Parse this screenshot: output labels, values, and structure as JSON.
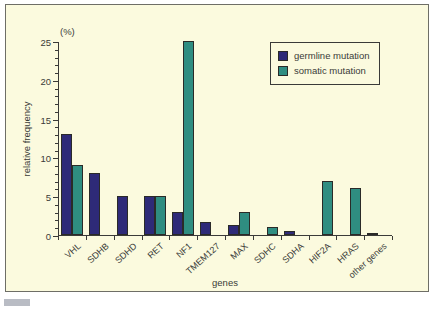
{
  "chart_data": {
    "type": "bar",
    "title": "",
    "xlabel": "genes",
    "ylabel": "relative frequency",
    "unit_label": "(%)",
    "ylim": [
      0,
      25
    ],
    "yticks": [
      0,
      5,
      10,
      15,
      20,
      25
    ],
    "yticks_minor": [
      1,
      2,
      3,
      4,
      6,
      7,
      8,
      9,
      11,
      12,
      13,
      14,
      16,
      17,
      18,
      19,
      21,
      22,
      23,
      24
    ],
    "grid": false,
    "legend_position": "top-right",
    "categories": [
      "VHL",
      "SDHB",
      "SDHD",
      "RET",
      "NF1",
      "TMEM127",
      "MAX",
      "SDHC",
      "SDHA",
      "HIF2A",
      "HRAS",
      "other genes"
    ],
    "series": [
      {
        "name": "germline mutation",
        "color": "#2e2a78",
        "values": [
          13,
          8,
          5,
          5,
          3,
          1.7,
          1.3,
          0,
          0.5,
          0,
          0,
          0.3
        ]
      },
      {
        "name": "somatic mutation",
        "color": "#2f8d81",
        "values": [
          9,
          0,
          0,
          5,
          25,
          0,
          3,
          1,
          0,
          7,
          6,
          0
        ]
      }
    ]
  },
  "legend": {
    "items": [
      {
        "label": "germline mutation",
        "series": "germline"
      },
      {
        "label": "somatic mutation",
        "series": "somatic"
      }
    ]
  },
  "caption": {
    "text": ""
  },
  "colors": {
    "background": "#fbfade",
    "frame": "#6e6e66",
    "axis": "#3a3a38",
    "germline": "#2e2a78",
    "somatic": "#2f8d81"
  }
}
